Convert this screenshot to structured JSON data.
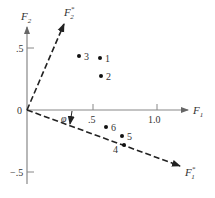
{
  "diagram": {
    "type": "factor-rotation-plot",
    "axes": {
      "x_label": "F",
      "x_sub": "1",
      "y_label": "F",
      "y_sub": "2",
      "origin_label": "0",
      "x_ticks": [
        ".5",
        "1.0"
      ],
      "y_ticks": [
        ".5",
        "−.5"
      ]
    },
    "rotated_axes": {
      "f1_star_label": "F",
      "f1_star_sub": "1",
      "f1_star_sup": "*",
      "f2_star_label": "F",
      "f2_star_sub": "2",
      "f2_star_sup": "*",
      "angle_label": "φ"
    },
    "points": [
      {
        "label": "1",
        "x": 0.55,
        "y": 0.42
      },
      {
        "label": "2",
        "x": 0.57,
        "y": 0.27
      },
      {
        "label": "3",
        "x": 0.39,
        "y": 0.44
      },
      {
        "label": "4",
        "x": 0.72,
        "y": -0.28
      },
      {
        "label": "5",
        "x": 0.74,
        "y": -0.21
      },
      {
        "label": "6",
        "x": 0.6,
        "y": -0.14
      }
    ],
    "colors": {
      "axis": "#888888",
      "dashed": "#222222",
      "point": "#111111",
      "text": "#333333"
    }
  }
}
